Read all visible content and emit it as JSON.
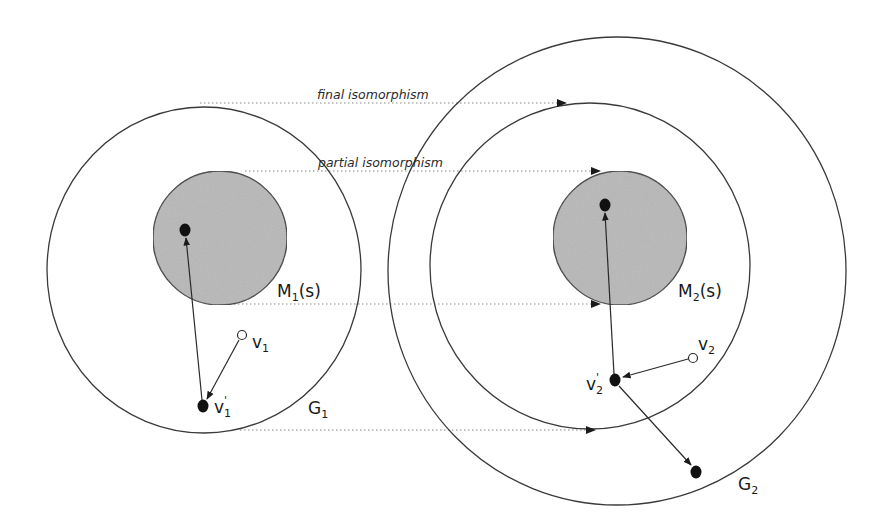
{
  "diagram": {
    "colors": {
      "stroke": "#3a3a3a",
      "subgraph_fill": "#b8b8b8",
      "node_fill": "#111111",
      "hollow_node_fill": "#ffffff",
      "dotted": "#888888",
      "background": "#ffffff"
    },
    "labels": {
      "final_isomorphism": "final isomorphism",
      "partial_isomorphism": "partial isomorphism",
      "m1": {
        "main": "M",
        "sub": "1",
        "suffix": "(s)"
      },
      "m2": {
        "main": "M",
        "sub": "2",
        "suffix": "(s)"
      },
      "g1": {
        "main": "G",
        "sub": "1"
      },
      "g2": {
        "main": "G",
        "sub": "2"
      },
      "v1": {
        "main": "v",
        "sub": "1"
      },
      "v1_prime": {
        "main": "v",
        "sub": "1",
        "prime": "'"
      },
      "v2": {
        "main": "v",
        "sub": "2"
      },
      "v2_prime": {
        "main": "v",
        "sub": "2",
        "prime": "'"
      }
    },
    "graphs": [
      {
        "id": "G1",
        "cx": 204,
        "cy": 270,
        "r": 160
      },
      {
        "id": "G1-extended",
        "cx": 590,
        "cy": 266,
        "r": 161
      },
      {
        "id": "G2",
        "cx": 617,
        "cy": 271,
        "r": 231
      }
    ],
    "subgraphs": [
      {
        "id": "M1(s)",
        "cx": 220,
        "cy": 238,
        "r": 67
      },
      {
        "id": "M2(s)",
        "cx": 620,
        "cy": 238,
        "r": 67
      }
    ],
    "nodes": [
      {
        "id": "m1-node",
        "x": 185,
        "y": 230,
        "type": "filled"
      },
      {
        "id": "v1",
        "x": 242,
        "y": 335,
        "type": "hollow"
      },
      {
        "id": "v1_prime",
        "x": 203,
        "y": 406,
        "type": "filled"
      },
      {
        "id": "m2-node",
        "x": 605,
        "y": 205,
        "type": "filled"
      },
      {
        "id": "v2",
        "x": 693,
        "y": 358,
        "type": "hollow"
      },
      {
        "id": "v2_prime",
        "x": 615,
        "y": 380,
        "type": "filled"
      },
      {
        "id": "g2-outer-node",
        "x": 696,
        "y": 472,
        "type": "filled"
      }
    ],
    "edges": [
      {
        "from": "v1",
        "to": "v1_prime"
      },
      {
        "from": "v1_prime",
        "to": "m1-node"
      },
      {
        "from": "v2",
        "to": "v2_prime"
      },
      {
        "from": "v2_prime",
        "to": "m2-node"
      },
      {
        "from": "v2_prime",
        "to": "g2-outer-node"
      }
    ],
    "mappings": [
      {
        "name": "final isomorphism",
        "y": 103,
        "x1": 200,
        "x2": 563
      },
      {
        "name": "partial isomorphism",
        "y": 171,
        "x1": 245,
        "x2": 597
      },
      {
        "name": "subgraph bottom",
        "y": 304,
        "x1": 222,
        "x2": 597
      },
      {
        "name": "graph bottom",
        "y": 430,
        "x1": 240,
        "x2": 592
      }
    ]
  }
}
